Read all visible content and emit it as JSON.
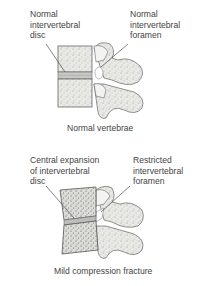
{
  "panels": [
    {
      "caption": "Normal vertebrae",
      "left_label": [
        "Normal",
        "intervertebral",
        "disc"
      ],
      "right_label": [
        "Normal",
        "intervertebral",
        "foramen"
      ]
    },
    {
      "caption": "Mild compression fracture",
      "left_label": [
        "Central expansion",
        "of intervertebral",
        "disc"
      ],
      "right_label": [
        "Restricted",
        "intervertebral",
        "foramen"
      ]
    }
  ]
}
